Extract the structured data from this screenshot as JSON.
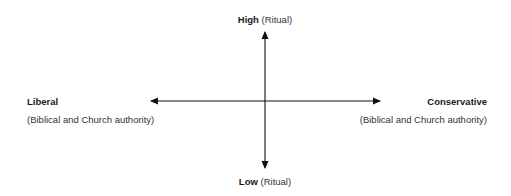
{
  "diagram": {
    "type": "quadrant-axes",
    "vertical_axis": {
      "top": {
        "label": "High",
        "qualifier": "(Ritual)"
      },
      "bottom": {
        "label": "Low",
        "qualifier": "(Ritual)"
      }
    },
    "horizontal_axis": {
      "left": {
        "label": "Liberal",
        "subtitle": "(Biblical and Church authority)"
      },
      "right": {
        "label": "Conservative",
        "subtitle": "(Biblical and Church authority)"
      }
    },
    "colors": {
      "axis": "#111111",
      "text": "#1a1a1a"
    }
  }
}
